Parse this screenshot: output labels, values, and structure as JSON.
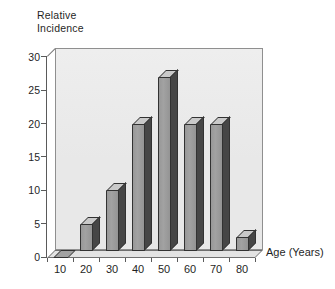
{
  "chart_data": {
    "type": "bar",
    "style": "3d-column",
    "title": "",
    "y_axis_title": "Relative\nIncidence",
    "x_axis_title": "Age (Years)",
    "categories": [
      "10",
      "20",
      "30",
      "40",
      "50",
      "60",
      "70",
      "80"
    ],
    "values": [
      0,
      5,
      10,
      20,
      27,
      20,
      20,
      3
    ],
    "y_ticks": [
      0,
      5,
      10,
      15,
      20,
      25,
      30
    ],
    "ylim": [
      0,
      30
    ],
    "grid": false,
    "legend": false,
    "colors": {
      "bar-front": "#a2a2a2",
      "bar-top": "#c9c9c9",
      "bar-side": "#464646",
      "bar-outline": "#323232",
      "wall": "#e8e8e8",
      "wall-border": "#8f8f8f",
      "floor": "#e3e3e3",
      "text": "#1f1f1f"
    }
  }
}
